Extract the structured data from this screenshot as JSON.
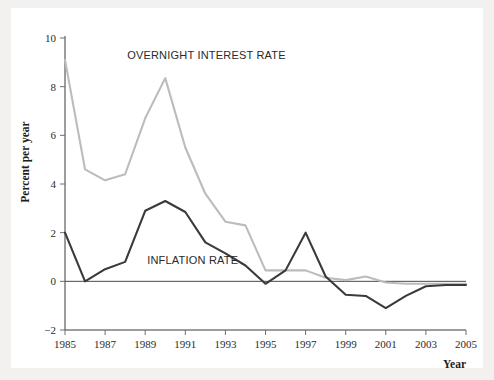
{
  "figure": {
    "background_color": "#ffffff",
    "page_background_color": "#f2f1ef"
  },
  "chart_data": {
    "type": "line",
    "title": "",
    "subtitle": "",
    "xlabel": "Year",
    "ylabel": "Percent per year",
    "xlim": [
      1985,
      2005
    ],
    "ylim": [
      -2,
      10
    ],
    "xticks": [
      1985,
      1987,
      1989,
      1991,
      1993,
      1995,
      1997,
      1999,
      2001,
      2003,
      2005
    ],
    "xtick_labels": [
      "1985",
      "1987",
      "1989",
      "1991",
      "1993",
      "1995",
      "1997",
      "1999",
      "2001",
      "2003",
      "2005"
    ],
    "yticks": [
      -2,
      0,
      2,
      4,
      6,
      8,
      10
    ],
    "ytick_labels": [
      "−2",
      "0",
      "2",
      "4",
      "6",
      "8",
      "10"
    ],
    "grid": false,
    "legend_position": "inline-annotation",
    "zero_line": true,
    "x": [
      1985,
      1986,
      1987,
      1988,
      1989,
      1990,
      1991,
      1992,
      1993,
      1994,
      1995,
      1996,
      1997,
      1998,
      1999,
      2000,
      2001,
      2002,
      2003,
      2004,
      2005
    ],
    "series": [
      {
        "name": "OVERNIGHT INTEREST RATE",
        "color": "#bcbcbc",
        "label_x": 1988.1,
        "label_y": 9.15,
        "values": [
          9.1,
          4.6,
          4.15,
          4.4,
          6.7,
          8.35,
          5.5,
          3.6,
          2.45,
          2.3,
          0.45,
          0.45,
          0.45,
          0.15,
          0.05,
          0.2,
          -0.05,
          -0.1,
          -0.1,
          -0.1,
          -0.1
        ]
      },
      {
        "name": "INFLATION RATE",
        "color": "#3a3a3a",
        "label_x": 1989.1,
        "label_y": 0.72,
        "values": [
          2.0,
          0.0,
          0.5,
          0.8,
          2.9,
          3.3,
          2.85,
          1.6,
          1.15,
          0.65,
          -0.1,
          0.45,
          2.0,
          0.2,
          -0.55,
          -0.6,
          -1.1,
          -0.6,
          -0.2,
          -0.15,
          -0.15
        ]
      }
    ],
    "annotations": [
      {
        "text": "OVERNIGHT INTEREST RATE",
        "series": "overnight"
      },
      {
        "text": "INFLATION RATE",
        "series": "inflation"
      }
    ]
  }
}
